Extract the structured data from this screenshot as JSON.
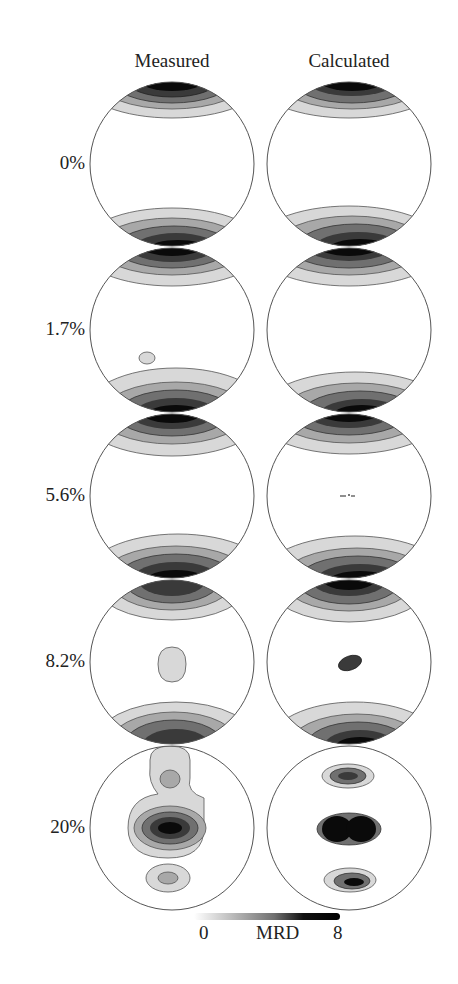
{
  "columns": [
    {
      "label": "Measured",
      "cx": 172
    },
    {
      "label": "Calculated",
      "cx": 349
    }
  ],
  "rows": [
    {
      "label": "0%",
      "cy": 164
    },
    {
      "label": "1.7%",
      "cy": 330
    },
    {
      "label": "5.6%",
      "cy": 496
    },
    {
      "label": "8.2%",
      "cy": 662
    },
    {
      "label": "20%",
      "cy": 828
    }
  ],
  "radius": 82,
  "colorbar": {
    "min_label": "0",
    "title": "MRD",
    "max_label": "8",
    "min_value": 0,
    "max_value": 8,
    "color_low": "#ffffff",
    "color_high": "#000000"
  },
  "colors": {
    "outline": "#555555",
    "level1": "#d8d8d8",
    "level2": "#a8a8a8",
    "level3": "#707070",
    "level4": "#3a3a3a",
    "level5": "#0a0a0a"
  }
}
